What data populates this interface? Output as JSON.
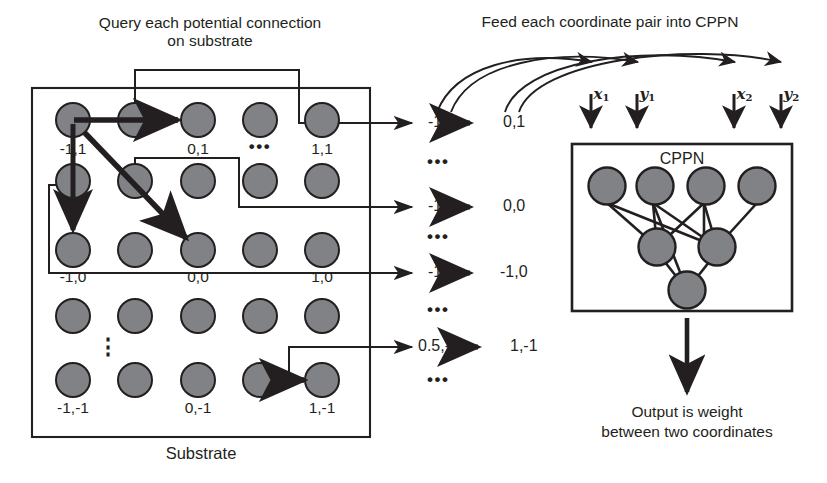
{
  "diagram": {
    "title_left": "Query each potential connection\non substrate",
    "title_right": "Feed each coordinate pair into CPPN",
    "substrate_label": "Substrate",
    "cppn_label": "CPPN",
    "output_label": "Output is weight\nbetween two coordinates"
  },
  "substrate": {
    "grid_rows": 5,
    "grid_cols": 5,
    "coordinate_labels": [
      {
        "text": "-1,1",
        "row": 0,
        "col": 0
      },
      {
        "text": "0,1",
        "row": 0,
        "col": 2
      },
      {
        "text": "1,1",
        "row": 0,
        "col": 4
      },
      {
        "text": "-1,0",
        "row": 2,
        "col": 0
      },
      {
        "text": "0,0",
        "row": 2,
        "col": 2
      },
      {
        "text": "1,0",
        "row": 2,
        "col": 4
      },
      {
        "text": "-1,-1",
        "row": 4,
        "col": 0
      },
      {
        "text": "0,-1",
        "row": 4,
        "col": 2
      },
      {
        "text": "1,-1",
        "row": 4,
        "col": 4
      }
    ],
    "ellipsis_horizontal": "•••",
    "ellipsis_vertical": "⋮",
    "queried_connections": [
      {
        "from": "-1,1",
        "to": "0,1"
      },
      {
        "from": "-1,1",
        "to": "-1,0"
      },
      {
        "from": "-1,1",
        "to": "0,0"
      },
      {
        "from": "0.5,-1",
        "to": "1,-1"
      }
    ]
  },
  "coordinate_pairs": {
    "rows": [
      {
        "source": "-1,1",
        "target": "0,1"
      },
      {
        "source": "-1,1",
        "target": "0,0"
      },
      {
        "source": "-1,1",
        "target": "-1,0"
      },
      {
        "source": "0.5,-1",
        "target": "1,-1"
      }
    ],
    "separator": "•••"
  },
  "cppn_inputs": [
    {
      "name": "x1",
      "base": "x",
      "sub": "1"
    },
    {
      "name": "y1",
      "base": "y",
      "sub": "1"
    },
    {
      "name": "x2",
      "base": "x",
      "sub": "2"
    },
    {
      "name": "y2",
      "base": "y",
      "sub": "2"
    }
  ],
  "cppn_network": {
    "input_nodes": 4,
    "hidden_nodes": 2,
    "output_nodes": 1
  },
  "colors": {
    "node_fill": "#808285",
    "node_stroke": "#231f20",
    "line": "#231f20",
    "text": "#231f20",
    "background": "#ffffff"
  }
}
